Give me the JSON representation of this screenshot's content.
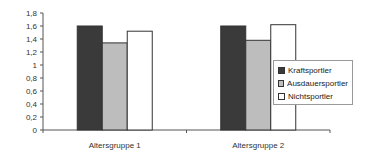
{
  "chart_data": {
    "type": "bar",
    "title": "",
    "xlabel": "",
    "ylabel": "",
    "ylim": [
      0,
      1.8
    ],
    "yticks": [
      "0",
      "0,2",
      "0,4",
      "0,6",
      "0,8",
      "1",
      "1,2",
      "1,4",
      "1,6",
      "1,8"
    ],
    "categories": [
      "Altersgruppe 1",
      "Altersgruppe 2"
    ],
    "series": [
      {
        "name": "Kraftsportler",
        "values": [
          1.6,
          1.6
        ],
        "color": "#3a3a3a"
      },
      {
        "name": "Ausdauersportler",
        "values": [
          1.34,
          1.38
        ],
        "color": "#bdbdbd"
      },
      {
        "name": "Nichtsportler",
        "values": [
          1.52,
          1.62
        ],
        "color": "#ffffff"
      }
    ],
    "grid": false,
    "legend_position": "right"
  }
}
